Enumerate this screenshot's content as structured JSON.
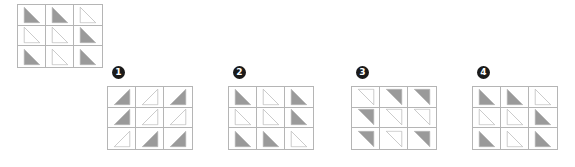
{
  "colors": {
    "fill": "#9a9a9a",
    "stroke": "#b5b5b5",
    "outline_fill": "#ffffff",
    "grid_line": "#b5b5b5",
    "label_bg": "#1a1a1a",
    "label_text": "#ffffff",
    "background": "#ffffff"
  },
  "stimulus": {
    "name": "stimulus-grid",
    "rows": 3,
    "cols": 3,
    "cells": [
      {
        "orientation": "top-left",
        "style": "filled"
      },
      {
        "orientation": "top-left",
        "style": "filled"
      },
      {
        "orientation": "top-left",
        "style": "outline"
      },
      {
        "orientation": "top-left",
        "style": "outline"
      },
      {
        "orientation": "top-left",
        "style": "outline"
      },
      {
        "orientation": "top-left",
        "style": "filled"
      },
      {
        "orientation": "top-left",
        "style": "filled"
      },
      {
        "orientation": "top-left",
        "style": "outline"
      },
      {
        "orientation": "top-left",
        "style": "filled"
      }
    ]
  },
  "options": [
    {
      "label": "❶",
      "number": "1",
      "name": "option-1",
      "cells": [
        {
          "orientation": "top-right",
          "style": "filled"
        },
        {
          "orientation": "top-right",
          "style": "outline"
        },
        {
          "orientation": "top-right",
          "style": "filled"
        },
        {
          "orientation": "top-right",
          "style": "filled"
        },
        {
          "orientation": "top-right",
          "style": "outline"
        },
        {
          "orientation": "top-right",
          "style": "outline"
        },
        {
          "orientation": "top-right",
          "style": "outline"
        },
        {
          "orientation": "top-right",
          "style": "filled"
        },
        {
          "orientation": "top-right",
          "style": "filled"
        }
      ]
    },
    {
      "label": "❷",
      "number": "2",
      "name": "option-2",
      "cells": [
        {
          "orientation": "top-left",
          "style": "filled"
        },
        {
          "orientation": "top-left",
          "style": "outline"
        },
        {
          "orientation": "top-left",
          "style": "filled"
        },
        {
          "orientation": "top-left",
          "style": "outline"
        },
        {
          "orientation": "top-left",
          "style": "outline"
        },
        {
          "orientation": "top-left",
          "style": "filled"
        },
        {
          "orientation": "top-left",
          "style": "filled"
        },
        {
          "orientation": "top-left",
          "style": "filled"
        },
        {
          "orientation": "top-left",
          "style": "outline"
        }
      ]
    },
    {
      "label": "❸",
      "number": "3",
      "name": "option-3",
      "cells": [
        {
          "orientation": "bottom-right",
          "style": "outline"
        },
        {
          "orientation": "bottom-right",
          "style": "filled"
        },
        {
          "orientation": "bottom-right",
          "style": "filled"
        },
        {
          "orientation": "bottom-right",
          "style": "filled"
        },
        {
          "orientation": "bottom-right",
          "style": "outline"
        },
        {
          "orientation": "bottom-right",
          "style": "outline"
        },
        {
          "orientation": "bottom-right",
          "style": "filled"
        },
        {
          "orientation": "bottom-right",
          "style": "outline"
        },
        {
          "orientation": "bottom-right",
          "style": "filled"
        }
      ]
    },
    {
      "label": "❹",
      "number": "4",
      "name": "option-4",
      "cells": [
        {
          "orientation": "top-left",
          "style": "filled"
        },
        {
          "orientation": "top-left",
          "style": "filled"
        },
        {
          "orientation": "top-left",
          "style": "outline"
        },
        {
          "orientation": "top-left",
          "style": "outline"
        },
        {
          "orientation": "top-left",
          "style": "outline"
        },
        {
          "orientation": "top-left",
          "style": "filled"
        },
        {
          "orientation": "top-left",
          "style": "filled"
        },
        {
          "orientation": "top-left",
          "style": "outline"
        },
        {
          "orientation": "top-left",
          "style": "filled"
        }
      ]
    }
  ]
}
